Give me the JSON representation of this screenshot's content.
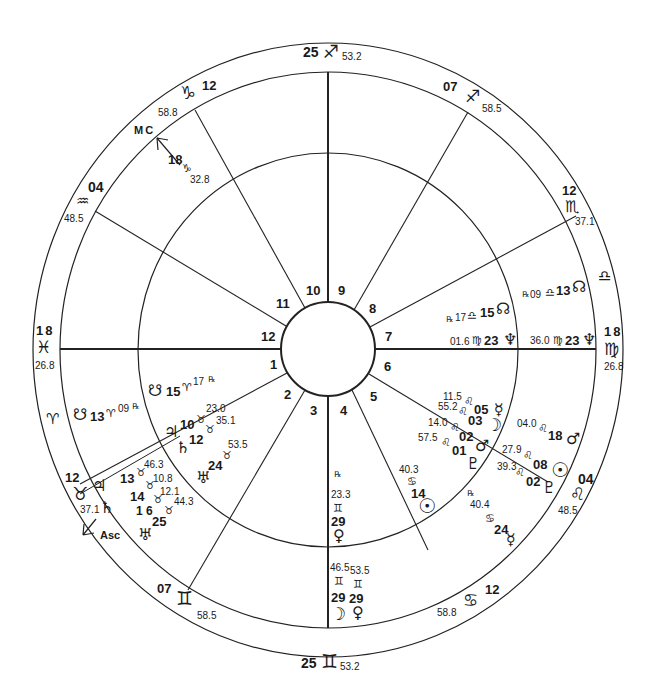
{
  "chart": {
    "type": "natal-wheel",
    "angles": {
      "asc": {
        "label": "Asc",
        "deg": "1 6",
        "sign": "♉",
        "min": ""
      },
      "mc": {
        "label": "MC",
        "deg": "18",
        "sign": "♑",
        "min": "32.8"
      }
    },
    "cusps": [
      {
        "id": "top",
        "deg": "25",
        "sign": "♐",
        "min": "53.2"
      },
      {
        "id": "upper-right-1",
        "deg": "07",
        "sign": "♐",
        "min": "58.5"
      },
      {
        "id": "upper-right-2",
        "deg": "12",
        "sign": "♏",
        "min": "37.1"
      },
      {
        "id": "right-libra",
        "deg": "",
        "sign": "♎",
        "min": ""
      },
      {
        "id": "right",
        "deg": "18",
        "sign": "♍",
        "min": "26.8"
      },
      {
        "id": "lower-right-1",
        "deg": "04",
        "sign": "♌",
        "min": "48.5"
      },
      {
        "id": "lower-right-2",
        "deg": "12",
        "sign": "♋",
        "min": "58.8"
      },
      {
        "id": "bottom",
        "deg": "25",
        "sign": "♊",
        "min": "53.2"
      },
      {
        "id": "lower-left-1",
        "deg": "07",
        "sign": "♊",
        "min": "58.5"
      },
      {
        "id": "lower-left-2",
        "deg": "12",
        "sign": "♉",
        "min": "37.1"
      },
      {
        "id": "left-aries",
        "deg": "",
        "sign": "♈",
        "min": ""
      },
      {
        "id": "left",
        "deg": "18",
        "sign": "♓",
        "min": "26.8"
      },
      {
        "id": "upper-left-1",
        "deg": "04",
        "sign": "♒",
        "min": "48.5"
      },
      {
        "id": "upper-left-2",
        "deg": "12",
        "sign": "♑",
        "min": "58.8"
      }
    ],
    "house_numbers": [
      "1",
      "2",
      "3",
      "4",
      "5",
      "6",
      "7",
      "8",
      "9",
      "10",
      "11",
      "12"
    ],
    "inner_planets": {
      "node_s_left": {
        "glyph": "☋",
        "deg": "15",
        "sign": "♈",
        "min": "17",
        "rx": "℞"
      },
      "jupiter": {
        "glyph": "♃",
        "deg": "10",
        "sign": "♉",
        "min": "23.0"
      },
      "saturn": {
        "glyph": "♄",
        "deg": "12",
        "sign": "♉",
        "min": "35.1"
      },
      "uranus": {
        "glyph": "♅",
        "deg": "24",
        "sign": "♉",
        "min": "53.5"
      },
      "venus": {
        "glyph": "♀",
        "deg": "29",
        "sign": "♊",
        "min": "23.3",
        "rx": "℞"
      },
      "sun": {
        "glyph": "☉",
        "deg": "14",
        "sign": "♋",
        "min": "40.3"
      },
      "pluto": {
        "glyph": "♇",
        "deg": "01",
        "sign": "♌",
        "min": "57.5"
      },
      "mars": {
        "glyph": "♂",
        "deg": "02",
        "sign": "♌",
        "min": "14.0"
      },
      "moon": {
        "glyph": "☽",
        "deg": "03",
        "sign": "♌",
        "min": "55.2"
      },
      "mercury": {
        "glyph": "☿",
        "deg": "05",
        "sign": "♌",
        "min": "11.5"
      },
      "neptune": {
        "glyph": "♆",
        "deg": "23",
        "sign": "♍",
        "min": "01.6"
      },
      "node_n": {
        "glyph": "☊",
        "deg": "15",
        "sign": "♎",
        "min": "17",
        "rx": "℞"
      }
    },
    "outer_planets": {
      "node_s_left": {
        "glyph": "☋",
        "deg": "13",
        "sign": "♈",
        "min": "09",
        "rx": "℞"
      },
      "jupiter": {
        "glyph": "♃",
        "deg": "13",
        "sign": "♉",
        "min": "46.3"
      },
      "saturn": {
        "glyph": "♄",
        "deg": "14",
        "sign": "♉",
        "min": "10.8"
      },
      "asc_deg": {
        "deg": "1 6",
        "sign": "♉",
        "min": "12.1"
      },
      "uranus": {
        "glyph": "♅",
        "deg": "25",
        "sign": "♉",
        "min": "44.3"
      },
      "moon": {
        "glyph": "☽",
        "deg": "29",
        "sign": "♊",
        "min": "46.5"
      },
      "venus": {
        "glyph": "♀",
        "deg": "29",
        "sign": "♊",
        "min": "53.5"
      },
      "mercury": {
        "glyph": "☿",
        "deg": "24",
        "sign": "♋",
        "min": "40.4",
        "rx": "℞"
      },
      "pluto": {
        "glyph": "♇",
        "deg": "02",
        "sign": "♌",
        "min": "39.3"
      },
      "sun": {
        "glyph": "☉",
        "deg": "08",
        "sign": "♌",
        "min": "27.9"
      },
      "mars": {
        "glyph": "♂",
        "deg": "18",
        "sign": "♌",
        "min": "04.0"
      },
      "neptune": {
        "glyph": "♆",
        "deg": "23",
        "sign": "♍",
        "min": "36.0"
      },
      "node_n": {
        "glyph": "☊",
        "deg": "13",
        "sign": "♎",
        "min": "09",
        "rx": "℞"
      }
    }
  }
}
